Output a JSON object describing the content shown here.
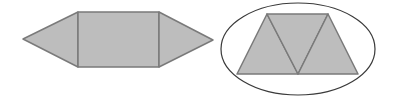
{
  "figure": {
    "width": 396,
    "height": 107,
    "background": "#ffffff",
    "fill_color": "#bdbdbd",
    "stroke_color": "#7a7a7a",
    "outline_color": "#3a3a3a"
  },
  "shapes": {
    "left_figure": {
      "description": "Hexagon composed of a rectangle with two isosceles triangles on the left and right sides",
      "rectangle": {
        "points": "78,12 159,12 159,67 78,67"
      },
      "left_triangle": {
        "points": "23,39 78,12 78,67"
      },
      "right_triangle": {
        "points": "159,12 213,40 159,67"
      }
    },
    "right_figure": {
      "description": "Trapezoid made of three triangles, enclosed in an ellipse",
      "ellipse": {
        "cx": 298,
        "cy": 49,
        "rx": 77,
        "ry": 46
      },
      "triangle_left": {
        "points": "267,14 237,74 298,74"
      },
      "triangle_middle": {
        "points": "267,14 328,14 298,74"
      },
      "triangle_right": {
        "points": "328,14 358,74 298,74"
      }
    }
  }
}
